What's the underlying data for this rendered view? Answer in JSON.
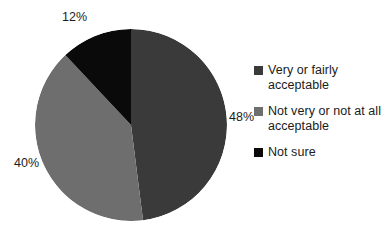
{
  "chart_data": {
    "type": "pie",
    "title": "",
    "categories": [
      "Very or fairly acceptable",
      "Not very or not at all acceptable",
      "Not sure"
    ],
    "values": [
      48,
      40,
      12
    ],
    "value_labels": [
      "48%",
      "40%",
      "12%"
    ],
    "colors": [
      "#3a3a3a",
      "#6e6e6e",
      "#0a0a0a"
    ],
    "units": "percent",
    "start_angle_deg": 0,
    "direction": "clockwise",
    "legend_position": "right",
    "grid": false,
    "xlabel": "",
    "ylabel": ""
  },
  "labels": {
    "slice_12": "12%",
    "slice_40": "40%",
    "slice_48": "48%"
  },
  "legend": {
    "items": [
      {
        "label": "Very or fairly acceptable",
        "color": "#3a3a3a",
        "swatch_name": "legend-swatch-very-or-fairly-acceptable"
      },
      {
        "label": "Not very or not at all acceptable",
        "color": "#6e6e6e",
        "swatch_name": "legend-swatch-not-very-or-not-at-all-acceptable"
      },
      {
        "label": "Not sure",
        "color": "#0a0a0a",
        "swatch_name": "legend-swatch-not-sure"
      }
    ]
  },
  "title_remnant": "cropped title"
}
